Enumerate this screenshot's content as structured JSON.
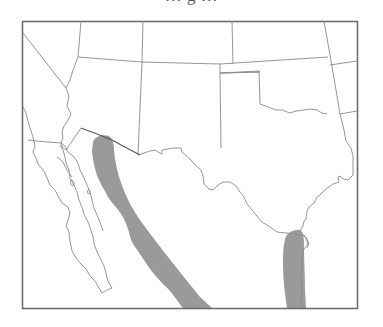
{
  "figure": {
    "title": "… g …",
    "title_note": "Title text is cropped at the top edge; only a descender of the letter 'g' is visible."
  },
  "map": {
    "region": "Southwestern United States and northwestern Mexico",
    "visible_features": [
      "state-borders",
      "us-mexico-border",
      "baja-california-peninsula",
      "gulf-of-california",
      "gulf-of-mexico-coast"
    ],
    "colors": {
      "background": "#ffffff",
      "lines": "#8a8a8a",
      "frame": "#6e6e6e",
      "range_fill": "#9a9a9a"
    },
    "range_areas": [
      {
        "id": "west-range",
        "description": "Band along the western Sierra Madre / Sonora–Sinaloa coastal slope, from southern Arizona border south-eastward"
      },
      {
        "id": "east-range",
        "description": "Band along the Gulf of Mexico coastal plain of northeastern Mexico, reaching the southern tip of Texas"
      }
    ]
  }
}
